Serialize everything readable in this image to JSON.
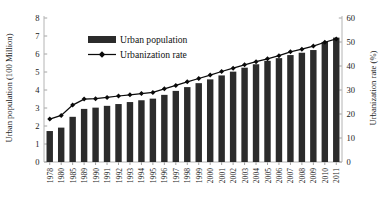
{
  "chart_data": {
    "type": "bar",
    "title": "",
    "subtitle": "",
    "xlabel": "",
    "ylabel": "Urban population (100 Million)",
    "y2label": "Urbanization rate (%)",
    "ylim": [
      0,
      8
    ],
    "y2lim": [
      0,
      60
    ],
    "yticks": [
      "0",
      "1",
      "2",
      "3",
      "4",
      "5",
      "6",
      "7",
      "8"
    ],
    "y2ticks": [
      "0",
      "10",
      "20",
      "30",
      "40",
      "50",
      "60"
    ],
    "grid": false,
    "legend_position": "upper-left-inside",
    "categories": [
      "1978",
      "1980",
      "1985",
      "1989",
      "1990",
      "1991",
      "1992",
      "1993",
      "1994",
      "1995",
      "1996",
      "1997",
      "1998",
      "1999",
      "2000",
      "2001",
      "2002",
      "2003",
      "2004",
      "2005",
      "2006",
      "2007",
      "2008",
      "2009",
      "2010",
      "2011"
    ],
    "series": [
      {
        "name": "Urban population",
        "kind": "bar",
        "axis": "left",
        "unit": "100 Million",
        "color": "#2b2b2b",
        "values": [
          1.72,
          1.91,
          2.51,
          2.95,
          3.02,
          3.12,
          3.22,
          3.33,
          3.43,
          3.52,
          3.73,
          3.95,
          4.16,
          4.38,
          4.59,
          4.81,
          5.02,
          5.24,
          5.43,
          5.62,
          5.77,
          5.94,
          6.07,
          6.22,
          6.67,
          6.91
        ]
      },
      {
        "name": "Urbanization rate",
        "kind": "line",
        "axis": "right",
        "unit": "%",
        "color": "#0a0a0a",
        "marker": "diamond",
        "values": [
          17.9,
          19.4,
          23.7,
          26.2,
          26.4,
          26.9,
          27.5,
          28.0,
          28.5,
          29.0,
          30.5,
          31.9,
          33.4,
          34.8,
          36.2,
          37.7,
          39.1,
          40.5,
          41.8,
          43.0,
          44.3,
          45.9,
          47.0,
          48.3,
          49.9,
          51.3
        ]
      }
    ],
    "legend": [
      {
        "label": "Urban population",
        "marker": "bar-swatch",
        "color": "#2b2b2b"
      },
      {
        "label": "Urbanization rate",
        "marker": "line-diamond",
        "color": "#0a0a0a"
      }
    ]
  }
}
